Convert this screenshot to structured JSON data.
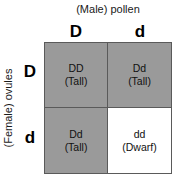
{
  "figure": {
    "type": "punnett-square",
    "title_top": "(Male) pollen",
    "title_left": "(Female) ovules",
    "colors": {
      "shaded_cell": "#9a9a9a",
      "unshaded_cell": "#ffffff",
      "grid_line": "#5a5a5a",
      "text": "#111111",
      "background": "#ffffff"
    }
  },
  "columns": [
    {
      "allele": "D"
    },
    {
      "allele": "d"
    }
  ],
  "rows": [
    {
      "allele": "D"
    },
    {
      "allele": "d"
    }
  ],
  "cells": [
    {
      "genotype": "DD",
      "phenotype": "(Tall)",
      "shaded": true,
      "row": 0,
      "col": 0
    },
    {
      "genotype": "Dd",
      "phenotype": "(Tall)",
      "shaded": true,
      "row": 0,
      "col": 1
    },
    {
      "genotype": "Dd",
      "phenotype": "(Tall)",
      "shaded": true,
      "row": 1,
      "col": 0
    },
    {
      "genotype": "dd",
      "phenotype": "(Dwarf)",
      "shaded": false,
      "row": 1,
      "col": 1
    }
  ]
}
